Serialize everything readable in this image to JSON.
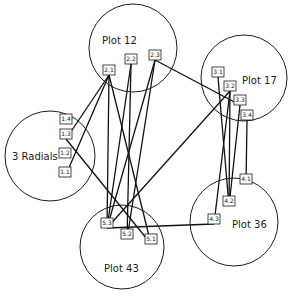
{
  "diagram": {
    "colors": {
      "line": "#111111",
      "background": "#ffffff"
    },
    "plots": [
      {
        "id": "p12",
        "label": "Plot 12",
        "cx": 133,
        "cy": 48,
        "r": 44,
        "lx": 102,
        "ly": 44
      },
      {
        "id": "p17",
        "label": "Plot 17",
        "cx": 244,
        "cy": 78,
        "r": 43,
        "lx": 242,
        "ly": 84
      },
      {
        "id": "radials",
        "label": "3 Radials",
        "cx": 50,
        "cy": 156,
        "r": 45,
        "lx": 12,
        "ly": 160
      },
      {
        "id": "p36",
        "label": "Plot 36",
        "cx": 234,
        "cy": 222,
        "r": 44,
        "lx": 232,
        "ly": 228
      },
      {
        "id": "p43",
        "label": "Plot 43",
        "cx": 122,
        "cy": 247,
        "r": 42,
        "lx": 104,
        "ly": 272
      }
    ],
    "nodes": [
      {
        "id": "2.1",
        "label": "2.1",
        "x": 109,
        "y": 75
      },
      {
        "id": "2.2",
        "label": "2.2",
        "x": 131,
        "y": 64
      },
      {
        "id": "2.3",
        "label": "2.3",
        "x": 155,
        "y": 60
      },
      {
        "id": "1.4",
        "label": "1.4",
        "x": 66,
        "y": 124
      },
      {
        "id": "1.3",
        "label": "1.3",
        "x": 66,
        "y": 139
      },
      {
        "id": "1.2",
        "label": "1.2",
        "x": 65,
        "y": 158
      },
      {
        "id": "1.1",
        "label": "1.1",
        "x": 65,
        "y": 177
      },
      {
        "id": "3.1",
        "label": "3.1",
        "x": 218,
        "y": 77
      },
      {
        "id": "3.2",
        "label": "3.2",
        "x": 230,
        "y": 91
      },
      {
        "id": "3.3",
        "label": "3.3",
        "x": 240,
        "y": 105
      },
      {
        "id": "3.4",
        "label": "3.4",
        "x": 247,
        "y": 120
      },
      {
        "id": "4.1",
        "label": "4.1",
        "x": 246,
        "y": 184
      },
      {
        "id": "4.2",
        "label": "4.2",
        "x": 229,
        "y": 206
      },
      {
        "id": "4.3",
        "label": "4.3",
        "x": 214,
        "y": 224
      },
      {
        "id": "5.3",
        "label": "5.3",
        "x": 107,
        "y": 228
      },
      {
        "id": "5.2",
        "label": "5.2",
        "x": 127,
        "y": 239
      },
      {
        "id": "5.1",
        "label": "5.1",
        "x": 151,
        "y": 244
      }
    ],
    "edges": [
      [
        "2.1",
        "1.3"
      ],
      [
        "2.1",
        "1.1"
      ],
      [
        "2.1",
        "5.3"
      ],
      [
        "2.1",
        "5.1"
      ],
      [
        "2.2",
        "5.3"
      ],
      [
        "2.2",
        "5.2"
      ],
      [
        "2.3",
        "5.3"
      ],
      [
        "2.3",
        "5.2"
      ],
      [
        "2.3",
        "3.3"
      ],
      [
        "1.3",
        "5.1"
      ],
      [
        "3.2",
        "5.3"
      ],
      [
        "3.1",
        "4.2"
      ],
      [
        "3.2",
        "4.2"
      ],
      [
        "3.3",
        "4.2"
      ],
      [
        "3.4",
        "4.1"
      ],
      [
        "3.2",
        "4.3"
      ],
      [
        "5.3",
        "4.3"
      ]
    ]
  }
}
